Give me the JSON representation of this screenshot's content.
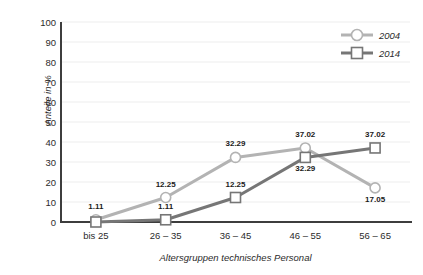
{
  "chart_data": {
    "type": "line",
    "title": "",
    "xlabel": "Altersgruppen technisches Personal",
    "ylabel": "Anteile in %",
    "categories": [
      "bis 25",
      "26 – 35",
      "36 – 45",
      "46 – 55",
      "56 – 65"
    ],
    "ylim": [
      0,
      100
    ],
    "ytick_step": 10,
    "yticks": [
      "100",
      "90",
      "80",
      "70",
      "60",
      "50",
      "40",
      "30",
      "20",
      "10",
      "0"
    ],
    "grid": "horizontal",
    "legend_position": "top-right",
    "series": [
      {
        "name": "2004",
        "marker": "circle",
        "color": "#b3b3b3",
        "values": [
          1.11,
          12.25,
          32.29,
          37.02,
          17.05
        ],
        "labels": [
          "1.11",
          "12.25",
          "32.29",
          "37.02",
          "17.05"
        ],
        "label_positions": [
          "above",
          "above",
          "above",
          "above",
          "below"
        ]
      },
      {
        "name": "2014",
        "marker": "square",
        "color": "#767676",
        "values": [
          0.0,
          1.11,
          12.25,
          32.29,
          37.02
        ],
        "labels": [
          "",
          "1.11",
          "12.25",
          "32.29",
          "37.02"
        ],
        "label_positions": [
          "",
          "above",
          "above",
          "below",
          "above"
        ]
      }
    ]
  },
  "legend": {
    "items": [
      {
        "label": "2004",
        "marker": "circle-marker-icon"
      },
      {
        "label": "2014",
        "marker": "square-marker-icon"
      }
    ]
  },
  "colors": {
    "series_2004": "#b3b3b3",
    "series_2014": "#767676",
    "axis": "#3d3d3d",
    "grid": "#ededed",
    "text": "#2b2b2b"
  }
}
